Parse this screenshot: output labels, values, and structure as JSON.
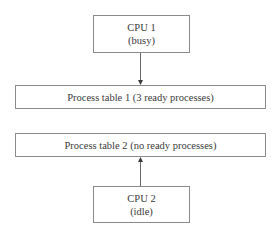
{
  "diagram": {
    "type": "block-diagram",
    "nodes": [
      {
        "id": "cpu1",
        "title": "CPU 1",
        "subtitle": "(busy)"
      },
      {
        "id": "table1",
        "label": "Process table 1 (3 ready processes)"
      },
      {
        "id": "table2",
        "label": "Process table 2 (no ready processes)"
      },
      {
        "id": "cpu2",
        "title": "CPU 2",
        "subtitle": "(idle)"
      }
    ],
    "edges": [
      {
        "from": "cpu1",
        "to": "table1",
        "direction": "down"
      },
      {
        "from": "cpu2",
        "to": "table2",
        "direction": "up"
      }
    ],
    "colors": {
      "line": "#8a8a8a",
      "text": "#3a3a3a",
      "background": "#ffffff"
    }
  }
}
